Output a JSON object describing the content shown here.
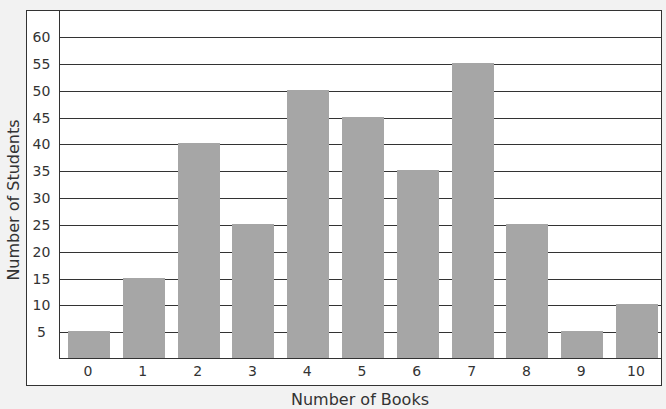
{
  "chart_data": {
    "type": "bar",
    "title": "",
    "categories": [
      "0",
      "1",
      "2",
      "3",
      "4",
      "5",
      "6",
      "7",
      "8",
      "9",
      "10"
    ],
    "values": [
      5,
      15,
      40,
      25,
      50,
      45,
      35,
      55,
      25,
      5,
      10
    ],
    "xlabel": "Number of Books",
    "ylabel": "Number of Students",
    "ylim": [
      0,
      60
    ],
    "yticks": [
      5,
      10,
      15,
      20,
      25,
      30,
      35,
      40,
      45,
      50,
      55,
      60
    ],
    "grid": true,
    "legend": null,
    "bar_color": "#a6a6a6"
  }
}
